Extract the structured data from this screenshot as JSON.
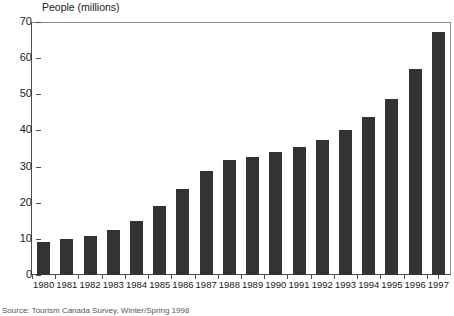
{
  "chart_data": {
    "type": "bar",
    "title": "People (millions)",
    "xlabel": "",
    "ylabel": "People (millions)",
    "ylim": [
      0,
      70
    ],
    "ytick_interval": 10,
    "yticks": [
      0,
      10,
      20,
      30,
      40,
      50,
      60,
      70
    ],
    "ytick_labels": [
      "0",
      "10",
      "20",
      "30",
      "40",
      "50",
      "60",
      "70"
    ],
    "grid": false,
    "legend": "none",
    "bar_color": "#333333",
    "axis_color": "#4d4d4d",
    "categories": [
      "1980",
      "1981",
      "1982",
      "1983",
      "1984",
      "1985",
      "1986",
      "1987",
      "1988",
      "1989",
      "1990",
      "1991",
      "1992",
      "1993",
      "1994",
      "1995",
      "1996",
      "1997"
    ],
    "values": [
      9,
      10,
      10.7,
      12.5,
      15,
      19,
      23.8,
      28.7,
      31.8,
      32.7,
      34,
      35.4,
      37.4,
      40.2,
      43.6,
      48.6,
      56.9,
      67.1
    ],
    "series": [
      {
        "name": "People (millions)",
        "values": [
          9,
          10,
          10.7,
          12.5,
          15,
          19,
          23.8,
          28.7,
          31.8,
          32.7,
          34,
          35.4,
          37.4,
          40.2,
          43.6,
          48.6,
          56.9,
          67.1
        ]
      }
    ]
  },
  "source_note": "Source: Tourism Canada Survey, Winter/Spring 1998"
}
